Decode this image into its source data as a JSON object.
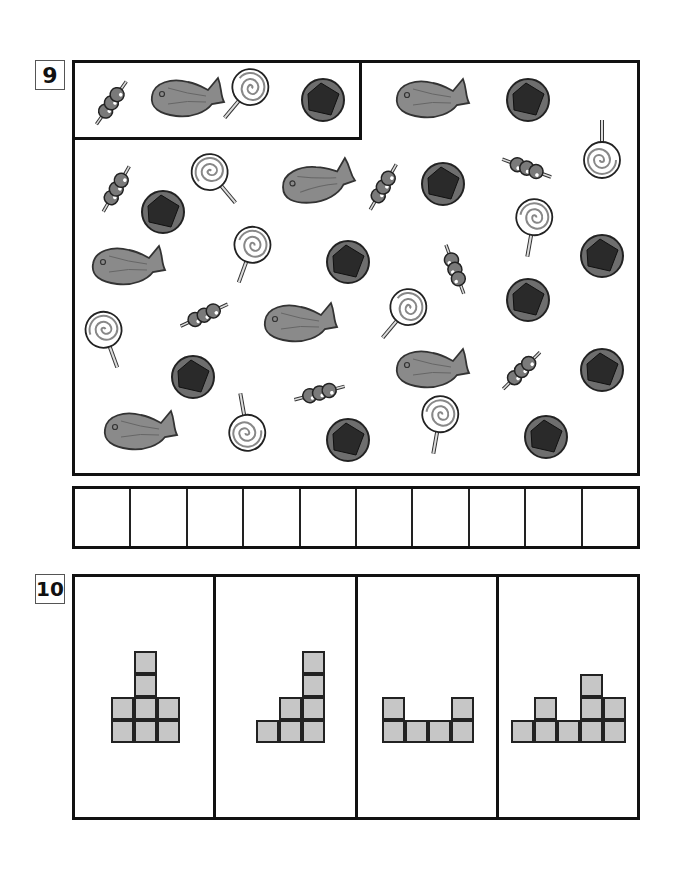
{
  "question9": {
    "number": "9",
    "example_items": [
      "dango",
      "taiyaki",
      "lollipop",
      "ohagi"
    ],
    "items": [
      {
        "type": "taiyaki",
        "x": 432,
        "y": 98,
        "r": 0
      },
      {
        "type": "ohagi",
        "x": 528,
        "y": 100,
        "r": 0
      },
      {
        "type": "lollipop",
        "x": 602,
        "y": 145,
        "r": 180
      },
      {
        "type": "dango",
        "x": 118,
        "y": 188,
        "r": -60
      },
      {
        "type": "ohagi",
        "x": 163,
        "y": 212,
        "r": 0
      },
      {
        "type": "lollipop",
        "x": 218,
        "y": 180,
        "r": -40
      },
      {
        "type": "taiyaki",
        "x": 318,
        "y": 182,
        "r": -10
      },
      {
        "type": "dango",
        "x": 385,
        "y": 186,
        "r": -60
      },
      {
        "type": "ohagi",
        "x": 443,
        "y": 184,
        "r": 0
      },
      {
        "type": "dango",
        "x": 526,
        "y": 168,
        "r": 20
      },
      {
        "type": "taiyaki",
        "x": 128,
        "y": 265,
        "r": 0
      },
      {
        "type": "lollipop",
        "x": 248,
        "y": 255,
        "r": 20
      },
      {
        "type": "ohagi",
        "x": 348,
        "y": 262,
        "r": 0
      },
      {
        "type": "dango",
        "x": 453,
        "y": 268,
        "r": 70
      },
      {
        "type": "lollipop",
        "x": 532,
        "y": 228,
        "r": 10
      },
      {
        "type": "ohagi",
        "x": 602,
        "y": 256,
        "r": 0
      },
      {
        "type": "lollipop",
        "x": 108,
        "y": 340,
        "r": -20
      },
      {
        "type": "dango",
        "x": 205,
        "y": 315,
        "r": -25
      },
      {
        "type": "taiyaki",
        "x": 300,
        "y": 322,
        "r": 0
      },
      {
        "type": "lollipop",
        "x": 400,
        "y": 315,
        "r": 40
      },
      {
        "type": "ohagi",
        "x": 528,
        "y": 300,
        "r": 0
      },
      {
        "type": "ohagi",
        "x": 193,
        "y": 377,
        "r": 0
      },
      {
        "type": "dango",
        "x": 320,
        "y": 393,
        "r": -15
      },
      {
        "type": "taiyaki",
        "x": 432,
        "y": 368,
        "r": 0
      },
      {
        "type": "dango",
        "x": 523,
        "y": 370,
        "r": -45
      },
      {
        "type": "ohagi",
        "x": 602,
        "y": 370,
        "r": 0
      },
      {
        "type": "taiyaki",
        "x": 140,
        "y": 430,
        "r": 0
      },
      {
        "type": "lollipop",
        "x": 245,
        "y": 418,
        "r": 170
      },
      {
        "type": "ohagi",
        "x": 348,
        "y": 440,
        "r": 0
      },
      {
        "type": "lollipop",
        "x": 438,
        "y": 425,
        "r": 10
      },
      {
        "type": "ohagi",
        "x": 546,
        "y": 437,
        "r": 0
      }
    ],
    "answer_cells": 10
  },
  "question10": {
    "number": "10",
    "panels": [
      {
        "label": "A",
        "columns": [
          2,
          4,
          2
        ]
      },
      {
        "label": "B",
        "columns": [
          1,
          2,
          4
        ]
      },
      {
        "label": "C",
        "columns": [
          2,
          1,
          1,
          2
        ]
      },
      {
        "label": "D",
        "columns": [
          1,
          2,
          1,
          3,
          2
        ]
      }
    ]
  },
  "colors": {
    "block_fill": "#c6c6c6",
    "line": "#111111",
    "dango": "#7a7a7a",
    "taiyaki": "#8a8a8a",
    "ohagi_outer": "#6e6e6e",
    "ohagi_inner": "#2a2a2a"
  }
}
